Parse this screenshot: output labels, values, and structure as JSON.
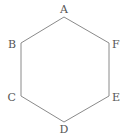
{
  "diagram": {
    "type": "regular-hexagon",
    "stroke_color": "#8a8a8a",
    "label_color": "#555555",
    "vertices": [
      {
        "name": "A",
        "x": 64,
        "y": 17,
        "label_x": 64,
        "label_y": 13,
        "anchor": "middle"
      },
      {
        "name": "F",
        "x": 109,
        "y": 43,
        "label_x": 112,
        "label_y": 48,
        "anchor": "start"
      },
      {
        "name": "E",
        "x": 109,
        "y": 96,
        "label_x": 112,
        "label_y": 101,
        "anchor": "start"
      },
      {
        "name": "D",
        "x": 64,
        "y": 122,
        "label_x": 64,
        "label_y": 133,
        "anchor": "middle"
      },
      {
        "name": "C",
        "x": 21,
        "y": 96,
        "label_x": 16,
        "label_y": 101,
        "anchor": "end"
      },
      {
        "name": "B",
        "x": 21,
        "y": 43,
        "label_x": 16,
        "label_y": 48,
        "anchor": "end"
      }
    ],
    "labels": {
      "A": "A",
      "B": "B",
      "C": "C",
      "D": "D",
      "E": "E",
      "F": "F"
    }
  }
}
